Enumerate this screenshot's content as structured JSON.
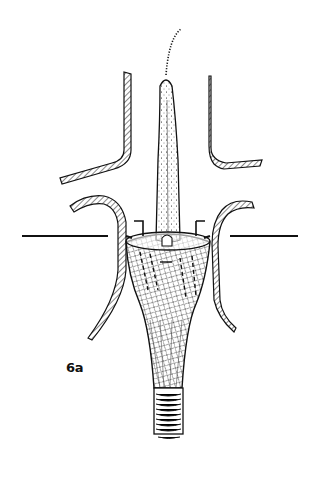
{
  "figure": {
    "label": "6a",
    "colors": {
      "ink": "#111111",
      "background": "#ffffff"
    }
  }
}
